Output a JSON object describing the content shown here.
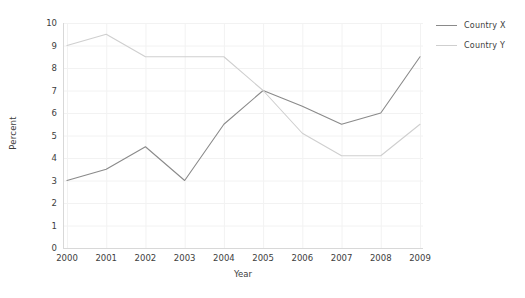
{
  "chart_data": {
    "type": "line",
    "title": "",
    "xlabel": "Year",
    "ylabel": "Percent",
    "categories": [
      "2000",
      "2001",
      "2002",
      "2003",
      "2004",
      "2005",
      "2006",
      "2007",
      "2008",
      "2009"
    ],
    "ylim": [
      0,
      10
    ],
    "yticks": [
      0,
      1,
      2,
      3,
      4,
      5,
      6,
      7,
      8,
      9,
      10
    ],
    "grid": true,
    "legend_position": "top-right",
    "series": [
      {
        "name": "Country X",
        "color": "#8a8a8a",
        "values": [
          3.0,
          3.5,
          4.5,
          3.0,
          5.5,
          7.0,
          6.3,
          5.5,
          6.0,
          8.5
        ]
      },
      {
        "name": "Country Y",
        "color": "#cfcfcf",
        "values": [
          9.0,
          9.5,
          8.5,
          8.5,
          8.5,
          7.0,
          5.1,
          4.1,
          4.1,
          5.5
        ]
      }
    ]
  },
  "colors": {
    "background": "#ffffff",
    "grid": "#f2f2f2",
    "spine": "#d8d8d8",
    "tick_text": "#3d3d3d"
  }
}
